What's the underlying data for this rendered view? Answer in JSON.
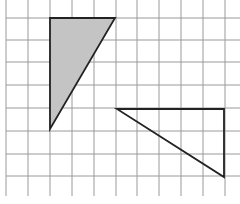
{
  "diagram": {
    "grid": {
      "vertical_x": [
        6,
        28,
        50,
        72,
        94,
        116,
        137,
        159,
        181,
        203,
        225
      ],
      "horizontal_y": [
        18,
        40,
        62,
        85,
        108,
        131,
        154,
        176
      ],
      "color": "#9a9a9a"
    },
    "shapes": [
      {
        "name": "shaded-triangle",
        "points": "50,18 115,18 50,129",
        "fill": "#c4c4c4",
        "stroke": "#222222"
      },
      {
        "name": "outline-triangle",
        "points": "117,109 224,109 224,177",
        "fill": "none",
        "stroke": "#222222"
      }
    ]
  }
}
